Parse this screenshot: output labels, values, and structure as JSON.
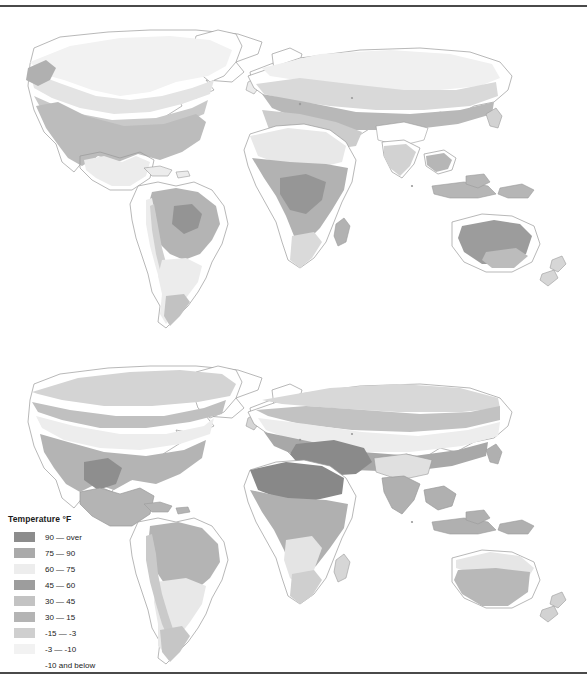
{
  "page": {
    "background_color": "#ffffff",
    "rule_color": "#4a4a4a"
  },
  "legend": {
    "title": "Temperature  °F",
    "units": "°F",
    "items": [
      {
        "label": "90 — over",
        "color": "#8c8c8c",
        "has_swatch": true
      },
      {
        "label": "75 — 90",
        "color": "#aaaaaa",
        "has_swatch": true
      },
      {
        "label": "60 — 75",
        "color": "#ededed",
        "has_swatch": true
      },
      {
        "label": "45 — 60",
        "color": "#9d9d9d",
        "has_swatch": true
      },
      {
        "label": "30 — 45",
        "color": "#c3c3c3",
        "has_swatch": true
      },
      {
        "label": "30 — 15",
        "color": "#b4b4b4",
        "has_swatch": true
      },
      {
        "label": "-15 — -3",
        "color": "#cfcfcf",
        "has_swatch": true
      },
      {
        "label": "-3 — -10",
        "color": "#f2f2f2",
        "has_swatch": true
      },
      {
        "label": "-10 and below",
        "color": "#ffffff",
        "has_swatch": false
      }
    ]
  },
  "maps": [
    {
      "name": "january-temperature-map",
      "description": "World map of mean January temperatures",
      "outline_color": "#9a9a9a"
    },
    {
      "name": "july-temperature-map",
      "description": "World map of mean July temperatures",
      "outline_color": "#9a9a9a"
    }
  ],
  "chart_data": {
    "type": "heatmap",
    "title": "Temperature °F",
    "xlabel": "",
    "ylabel": "",
    "legend_position": "bottom-left",
    "grid": false,
    "panels": [
      {
        "name": "january-temperature-map",
        "season": "January (winter, northern hemisphere)"
      },
      {
        "name": "july-temperature-map",
        "season": "July (summer, northern hemisphere)"
      }
    ],
    "categories": [
      "90 — over",
      "75 — 90",
      "60 — 75",
      "45 — 60",
      "30 — 45",
      "30 — 15",
      "-15 — -3",
      "-3 — -10",
      "-10 and below"
    ],
    "colors": [
      "#8c8c8c",
      "#aaaaaa",
      "#ededed",
      "#9d9d9d",
      "#c3c3c3",
      "#b4b4b4",
      "#cfcfcf",
      "#f2f2f2",
      "#ffffff"
    ]
  }
}
